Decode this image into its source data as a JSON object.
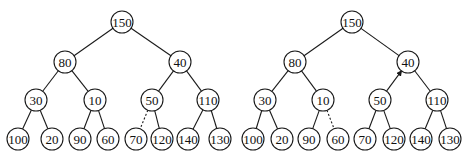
{
  "diagram": {
    "type": "binary-tree-pair",
    "node_radius": 11,
    "colors": {
      "stroke": "#1a1a1a",
      "fill": "#ffffff",
      "text": "#111111"
    },
    "trees": [
      {
        "id": "left-tree",
        "nodes": [
          {
            "id": "n150",
            "label": "150",
            "x": 122,
            "y": 22
          },
          {
            "id": "n80",
            "label": "80",
            "x": 65,
            "y": 62
          },
          {
            "id": "n40",
            "label": "40",
            "x": 180,
            "y": 62
          },
          {
            "id": "n30",
            "label": "30",
            "x": 36,
            "y": 100
          },
          {
            "id": "n10",
            "label": "10",
            "x": 95,
            "y": 100
          },
          {
            "id": "n50",
            "label": "50",
            "x": 152,
            "y": 100
          },
          {
            "id": "n110",
            "label": "110",
            "x": 208,
            "y": 100
          },
          {
            "id": "n100",
            "label": "100",
            "x": 18,
            "y": 139
          },
          {
            "id": "n20",
            "label": "20",
            "x": 52,
            "y": 139
          },
          {
            "id": "n90",
            "label": "90",
            "x": 80,
            "y": 139
          },
          {
            "id": "n60",
            "label": "60",
            "x": 108,
            "y": 139
          },
          {
            "id": "n70",
            "label": "70",
            "x": 136,
            "y": 139
          },
          {
            "id": "n120",
            "label": "120",
            "x": 162,
            "y": 139
          },
          {
            "id": "n140",
            "label": "140",
            "x": 188,
            "y": 139
          },
          {
            "id": "n130",
            "label": "130",
            "x": 220,
            "y": 139
          }
        ],
        "edges": [
          {
            "from": "n150",
            "to": "n80",
            "style": "solid"
          },
          {
            "from": "n150",
            "to": "n40",
            "style": "solid"
          },
          {
            "from": "n80",
            "to": "n30",
            "style": "solid"
          },
          {
            "from": "n80",
            "to": "n10",
            "style": "solid"
          },
          {
            "from": "n40",
            "to": "n50",
            "style": "solid"
          },
          {
            "from": "n40",
            "to": "n110",
            "style": "solid"
          },
          {
            "from": "n30",
            "to": "n100",
            "style": "solid"
          },
          {
            "from": "n30",
            "to": "n20",
            "style": "solid"
          },
          {
            "from": "n10",
            "to": "n90",
            "style": "solid"
          },
          {
            "from": "n10",
            "to": "n60",
            "style": "solid"
          },
          {
            "from": "n50",
            "to": "n70",
            "style": "dashed"
          },
          {
            "from": "n50",
            "to": "n120",
            "style": "solid"
          },
          {
            "from": "n110",
            "to": "n140",
            "style": "solid"
          },
          {
            "from": "n110",
            "to": "n130",
            "style": "solid"
          }
        ]
      },
      {
        "id": "right-tree",
        "nodes": [
          {
            "id": "m150",
            "label": "150",
            "x": 352,
            "y": 22
          },
          {
            "id": "m80",
            "label": "80",
            "x": 295,
            "y": 62
          },
          {
            "id": "m40",
            "label": "40",
            "x": 408,
            "y": 62
          },
          {
            "id": "m30",
            "label": "30",
            "x": 265,
            "y": 100
          },
          {
            "id": "m10",
            "label": "10",
            "x": 323,
            "y": 100
          },
          {
            "id": "m50",
            "label": "50",
            "x": 380,
            "y": 100
          },
          {
            "id": "m110",
            "label": "110",
            "x": 437,
            "y": 100
          },
          {
            "id": "m100",
            "label": "100",
            "x": 253,
            "y": 139
          },
          {
            "id": "m20",
            "label": "20",
            "x": 282,
            "y": 139
          },
          {
            "id": "m90",
            "label": "90",
            "x": 309,
            "y": 139
          },
          {
            "id": "m60",
            "label": "60",
            "x": 338,
            "y": 139
          },
          {
            "id": "m70",
            "label": "70",
            "x": 365,
            "y": 139
          },
          {
            "id": "m120",
            "label": "120",
            "x": 394,
            "y": 139
          },
          {
            "id": "m140",
            "label": "140",
            "x": 421,
            "y": 139
          },
          {
            "id": "m130",
            "label": "130",
            "x": 450,
            "y": 139
          }
        ],
        "edges": [
          {
            "from": "m150",
            "to": "m80",
            "style": "solid"
          },
          {
            "from": "m150",
            "to": "m40",
            "style": "solid"
          },
          {
            "from": "m80",
            "to": "m30",
            "style": "solid"
          },
          {
            "from": "m80",
            "to": "m10",
            "style": "solid"
          },
          {
            "from": "m40",
            "to": "m50",
            "style": "arrow"
          },
          {
            "from": "m40",
            "to": "m110",
            "style": "solid"
          },
          {
            "from": "m30",
            "to": "m100",
            "style": "solid"
          },
          {
            "from": "m30",
            "to": "m20",
            "style": "solid"
          },
          {
            "from": "m10",
            "to": "m90",
            "style": "solid"
          },
          {
            "from": "m10",
            "to": "m60",
            "style": "dashed"
          },
          {
            "from": "m50",
            "to": "m70",
            "style": "solid"
          },
          {
            "from": "m50",
            "to": "m120",
            "style": "solid"
          },
          {
            "from": "m110",
            "to": "m140",
            "style": "solid"
          },
          {
            "from": "m110",
            "to": "m130",
            "style": "solid"
          }
        ]
      }
    ]
  }
}
